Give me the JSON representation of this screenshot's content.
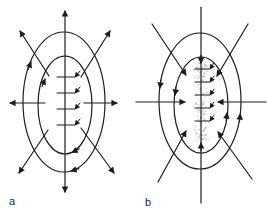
{
  "figure": {
    "background_color": "#ffffff",
    "line_color": "#1d1d1d",
    "label_color": "#2a2a2a",
    "stipple_color": "#9b9b9b",
    "panels": [
      {
        "label": "a",
        "straight_arrows": "outward",
        "curved_arrows_rotation": "clockwise",
        "center_feature": "vertical-crack-with-stepped-half-arrow-ticks",
        "tick_count": 4
      },
      {
        "label": "b",
        "straight_arrows": "inward",
        "curved_arrows_rotation": "counterclockwise",
        "center_feature": "stippled-vertical-seam-with-stepped-half-arrow-ticks",
        "tick_count": 5
      }
    ]
  }
}
